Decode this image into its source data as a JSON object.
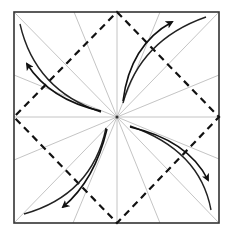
{
  "diagram": {
    "square": {
      "x1": 14,
      "y1": 12,
      "x2": 219,
      "y2": 223,
      "stroke": "#333333"
    },
    "center": {
      "x": 117,
      "y": 117
    },
    "colors": {
      "border": "#333333",
      "crease": "#b5b5b5",
      "valley_fold": "#111111",
      "arrow": "#222222",
      "background": "#ffffff"
    },
    "crease_lines": {
      "count": 16,
      "angle_step_deg": 22.5,
      "description": "Light gray radial creases from center to the square edge"
    },
    "valley_fold_diamond": {
      "description": "Dashed diamond connecting edge midpoints",
      "points": [
        [
          117,
          12
        ],
        [
          219,
          117
        ],
        [
          117,
          223
        ],
        [
          14,
          117
        ]
      ]
    },
    "arrows": [
      {
        "name": "arrow-top-right",
        "direction": "outward",
        "from": [
          123,
          102
        ],
        "to": [
          175,
          20
        ]
      },
      {
        "name": "arrow-bottom-right",
        "direction": "outward",
        "from": [
          128,
          126
        ],
        "to": [
          208,
          182
        ]
      },
      {
        "name": "arrow-bottom-left",
        "direction": "outward",
        "from": [
          107,
          128
        ],
        "to": [
          62,
          209
        ]
      },
      {
        "name": "arrow-top-left",
        "direction": "outward",
        "from": [
          101,
          112
        ],
        "to": [
          26,
          63
        ]
      }
    ],
    "curves": [
      {
        "name": "curve-top-right",
        "d": "M 123 103 Q 140 40 206 17"
      },
      {
        "name": "curve-bottom-right",
        "d": "M 130 126 Q 200 150 211 210"
      },
      {
        "name": "curve-bottom-left",
        "d": "M 106 128 Q 92 195 24 214"
      },
      {
        "name": "curve-top-left",
        "d": "M 101 112 Q 35 90 20 24"
      }
    ]
  }
}
